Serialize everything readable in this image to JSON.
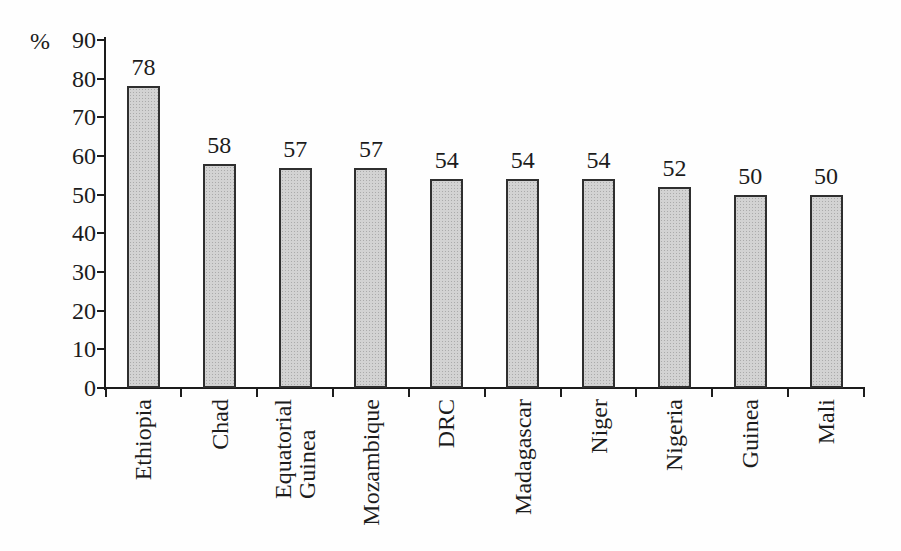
{
  "chart_data": {
    "type": "bar",
    "title": "",
    "xlabel": "",
    "ylabel": "%",
    "categories": [
      "Ethiopia",
      "Chad",
      "Equatorial\nGuinea",
      "Mozambique",
      "DRC",
      "Madagascar",
      "Niger",
      "Nigeria",
      "Guinea",
      "Mali"
    ],
    "values": [
      78,
      58,
      57,
      57,
      54,
      54,
      54,
      52,
      50,
      50
    ],
    "ylim": [
      0,
      90
    ],
    "yticks": [
      0,
      10,
      20,
      30,
      40,
      50,
      60,
      70,
      80,
      90
    ],
    "grid": false,
    "legend": "none",
    "bar_fill_color": "#d3d3d3",
    "bar_dot_color": "#ababab",
    "bar_border_color": "#2f2f2f",
    "axis_color": "#1c1c1c",
    "text_color": "#1c1c1c",
    "background_color": "#fefefe"
  }
}
